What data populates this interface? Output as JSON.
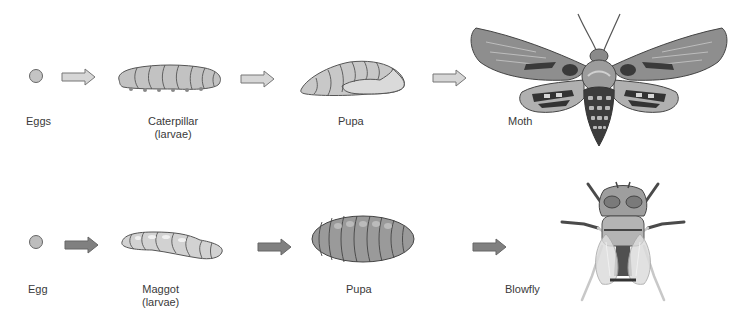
{
  "rows": [
    {
      "name": "moth-cycle",
      "stages": [
        {
          "label": "Eggs"
        },
        {
          "label": "Caterpillar",
          "sublabel": "(larvae)"
        },
        {
          "label": "Pupa"
        },
        {
          "label": "Moth"
        }
      ]
    },
    {
      "name": "blowfly-cycle",
      "stages": [
        {
          "label": "Egg"
        },
        {
          "label": "Maggot",
          "sublabel": "(larvae)"
        },
        {
          "label": "Pupa"
        },
        {
          "label": "Blowfly"
        }
      ]
    }
  ],
  "colors": {
    "outline": "#555555",
    "fill_light": "#c8c8c8",
    "fill_mid": "#9a9a9a",
    "fill_dark": "#3e3e3e",
    "arrow_top": "#d0d0d0",
    "arrow_bottom": "#7e7e7e"
  }
}
